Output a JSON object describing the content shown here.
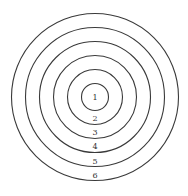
{
  "diagram": {
    "type": "concentric-circles-target",
    "center": {
      "x": 95,
      "y": 97
    },
    "rings": [
      {
        "label": "1",
        "radius": 13.5,
        "label_y": 101
      },
      {
        "label": "2",
        "radius": 27.5,
        "label_y": 120
      },
      {
        "label": "3",
        "radius": 41.5,
        "label_y": 134
      },
      {
        "label": "4",
        "radius": 55.5,
        "label_y": 149
      },
      {
        "label": "5",
        "radius": 69.5,
        "label_y": 163
      },
      {
        "label": "6",
        "radius": 83.5,
        "label_y": 177
      }
    ],
    "stroke_color": "#3a3a3a",
    "background": "#ffffff"
  }
}
